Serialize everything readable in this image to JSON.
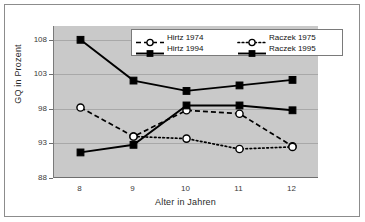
{
  "chart_data": {
    "type": "line",
    "title": "",
    "xlabel": "Alter in Jahren",
    "ylabel": "GQ in Prozent",
    "x": [
      8,
      9,
      10,
      11,
      12
    ],
    "xticklabels": [
      "8",
      "9",
      "10",
      "11",
      "12"
    ],
    "yticklabels": [
      "88",
      "93",
      "98",
      "103",
      "108"
    ],
    "yticks": [
      88,
      93,
      98,
      103,
      108
    ],
    "ylim": [
      88,
      110
    ],
    "xlim": [
      7.5,
      12.5
    ],
    "grid": true,
    "legend_position": "top-center",
    "plot_background": "#c9c9c9",
    "series": [
      {
        "name": "Hirtz 1974",
        "values": [
          98.2,
          94.0,
          97.8,
          97.3,
          92.6
        ],
        "line_style": "dashed",
        "marker": "open-circle",
        "color": "#000000"
      },
      {
        "name": "Hirtz 1994",
        "values": [
          108.0,
          102.1,
          100.6,
          101.4,
          102.2
        ],
        "line_style": "solid",
        "marker": "filled-square",
        "color": "#000000"
      },
      {
        "name": "Raczek 1975",
        "values": [
          null,
          94.0,
          93.7,
          92.2,
          92.5
        ],
        "line_style": "dotted",
        "marker": "open-circle",
        "color": "#000000"
      },
      {
        "name": "Raczek 1995",
        "values": [
          91.7,
          92.8,
          98.5,
          98.5,
          97.8
        ],
        "line_style": "solid",
        "marker": "filled-square",
        "color": "#000000"
      }
    ]
  },
  "legend": {
    "entries": [
      {
        "label": "Hirtz 1974"
      },
      {
        "label": "Raczek 1975"
      },
      {
        "label": "Hirtz 1994"
      },
      {
        "label": "Raczek 1995"
      }
    ]
  }
}
